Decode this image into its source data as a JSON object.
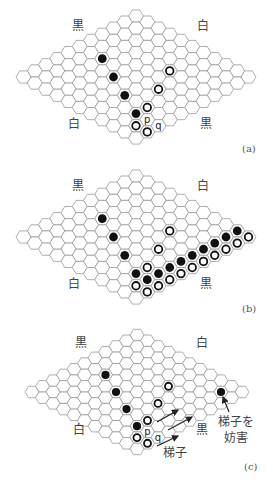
{
  "board": {
    "size": 11,
    "cell_color": "#ffffff",
    "line_color": "#9a9a9a",
    "black_stone": "#111111",
    "white_stone_ring": "#111111"
  },
  "panels": [
    {
      "id": "a",
      "caption": "(a)",
      "top": 0,
      "height": 160,
      "origin": [
        136,
        16
      ],
      "dx": 11.25,
      "dy": 6.1,
      "hexw": 15,
      "hexh": 12.2,
      "corner_labels": {
        "top_left": "黒",
        "top_right": "白",
        "bottom_left": "白",
        "bottom_right": "黒"
      },
      "label_pos": {
        "top_left": [
          72,
          20
        ],
        "top_right": [
          197,
          20
        ],
        "bottom_left": [
          68,
          118
        ],
        "bottom_right": [
          200,
          118
        ]
      },
      "caption_pos": [
        242,
        143
      ],
      "black": [
        [
          2,
          5
        ],
        [
          4,
          6
        ],
        [
          6,
          7
        ],
        [
          8,
          8
        ]
      ],
      "white": [
        [
          6,
          3
        ],
        [
          7,
          5
        ],
        [
          8,
          7
        ],
        [
          9,
          9
        ],
        [
          10,
          9
        ]
      ],
      "marks": [
        {
          "cell": [
            9,
            8
          ],
          "text": "p"
        },
        {
          "cell": [
            10,
            8
          ],
          "text": "q"
        }
      ],
      "arrows": [],
      "notes": []
    },
    {
      "id": "b",
      "caption": "(b)",
      "top": 160,
      "height": 160,
      "origin": [
        136,
        16
      ],
      "dx": 11.25,
      "dy": 6.1,
      "hexw": 15,
      "hexh": 12.2,
      "corner_labels": {
        "top_left": "黒",
        "top_right": "白",
        "bottom_left": "白",
        "bottom_right": "黒"
      },
      "label_pos": {
        "top_left": [
          72,
          20
        ],
        "top_right": [
          197,
          20
        ],
        "bottom_left": [
          68,
          118
        ],
        "bottom_right": [
          200,
          118
        ]
      },
      "caption_pos": [
        242,
        143
      ],
      "black": [
        [
          2,
          5
        ],
        [
          4,
          6
        ],
        [
          6,
          7
        ],
        [
          8,
          8
        ],
        [
          9,
          8
        ],
        [
          9,
          7
        ],
        [
          9,
          6
        ],
        [
          9,
          5
        ],
        [
          9,
          4
        ],
        [
          9,
          3
        ],
        [
          9,
          2
        ],
        [
          9,
          1
        ],
        [
          9,
          0
        ]
      ],
      "white": [
        [
          6,
          3
        ],
        [
          7,
          5
        ],
        [
          8,
          7
        ],
        [
          9,
          9
        ],
        [
          10,
          9
        ],
        [
          10,
          8
        ],
        [
          10,
          7
        ],
        [
          10,
          6
        ],
        [
          10,
          5
        ],
        [
          10,
          4
        ],
        [
          10,
          3
        ],
        [
          10,
          2
        ],
        [
          10,
          1
        ],
        [
          10,
          0
        ]
      ],
      "marks": [],
      "arrows": [],
      "notes": []
    },
    {
      "id": "c",
      "caption": "(c)",
      "top": 320,
      "height": 163,
      "origin": [
        137,
        15
      ],
      "dx": 10.5,
      "dy": 5.7,
      "hexw": 14,
      "hexh": 11.4,
      "corner_labels": {
        "top_left": "黒",
        "top_right": "白",
        "bottom_left": "白",
        "bottom_right": "黒"
      },
      "label_pos": {
        "top_left": [
          75,
          17
        ],
        "top_right": [
          196,
          17
        ],
        "bottom_left": [
          73,
          104
        ],
        "bottom_right": [
          196,
          104
        ]
      },
      "caption_pos": [
        244,
        141
      ],
      "black": [
        [
          2,
          5
        ],
        [
          4,
          6
        ],
        [
          6,
          7
        ],
        [
          8,
          8
        ],
        [
          9,
          1
        ]
      ],
      "white": [
        [
          6,
          3
        ],
        [
          7,
          5
        ],
        [
          8,
          7
        ],
        [
          9,
          9
        ],
        [
          10,
          9
        ]
      ],
      "marks": [
        {
          "cell": [
            9,
            8
          ],
          "text": "p"
        },
        {
          "cell": [
            10,
            8
          ],
          "text": "q"
        }
      ],
      "arrows": [
        {
          "from": [
            157,
            102
          ],
          "to": [
            178,
            90
          ]
        },
        {
          "from": [
            168,
            110
          ],
          "to": [
            192,
            97
          ]
        },
        {
          "from": [
            157,
            126
          ],
          "to": [
            178,
            116
          ]
        },
        {
          "from": [
            229,
            92
          ],
          "to": [
            223,
            77
          ]
        }
      ],
      "notes": [
        {
          "text": "梯子",
          "pos": [
            163,
            127
          ]
        },
        {
          "text": "梯子を",
          "pos": [
            218,
            96
          ]
        },
        {
          "text": "妨害",
          "pos": [
            224,
            112
          ]
        }
      ]
    }
  ]
}
